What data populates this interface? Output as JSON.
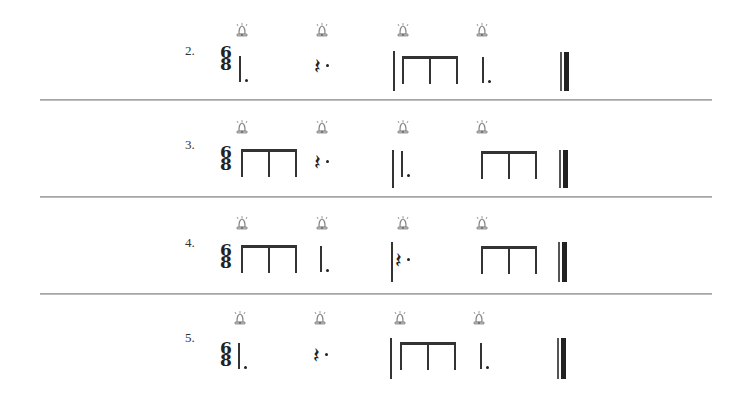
{
  "worksheet": {
    "time_signature": {
      "top": "6",
      "bottom": "8"
    },
    "icons": {
      "beat_marker": "bell-icon",
      "rest": "𝄽"
    },
    "colors": {
      "ink": "#222222",
      "divider": "#9a9a9a",
      "bell": "#888888"
    },
    "exercises": [
      {
        "number": "2.",
        "measures": [
          {
            "beats": [
              "dotted-quarter",
              "dotted-quarter-rest"
            ]
          },
          {
            "beats": [
              "three-eighths",
              "dotted-quarter"
            ]
          }
        ]
      },
      {
        "number": "3.",
        "measures": [
          {
            "beats": [
              "three-eighths",
              "dotted-quarter-rest"
            ]
          },
          {
            "beats": [
              "dotted-quarter",
              "three-eighths"
            ]
          }
        ]
      },
      {
        "number": "4.",
        "measures": [
          {
            "beats": [
              "three-eighths",
              "dotted-quarter"
            ]
          },
          {
            "beats": [
              "dotted-quarter-rest",
              "three-eighths"
            ]
          }
        ]
      },
      {
        "number": "5.",
        "measures": [
          {
            "beats": [
              "dotted-quarter",
              "dotted-quarter-rest"
            ]
          },
          {
            "beats": [
              "three-eighths",
              "dotted-quarter"
            ]
          }
        ]
      }
    ]
  }
}
